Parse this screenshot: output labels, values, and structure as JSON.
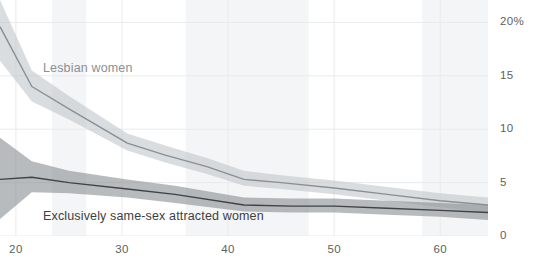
{
  "chart": {
    "background": "#ffffff",
    "plot_width": 488,
    "plot_height": 236,
    "grid": {
      "color": "#e8eaec",
      "band_color": "#f4f5f6",
      "show": true
    },
    "axis": {
      "y_label_color": "#5b5f63",
      "x_label_color": "#5b5f63"
    }
  },
  "labels": {
    "lesbian": "Lesbian women",
    "exclusive": "Exclusively same-sex attracted women"
  },
  "chart_data": {
    "type": "line",
    "title": "",
    "subtitle": "",
    "xlabel": "",
    "ylabel": "",
    "xlim": [
      18.5,
      64.5
    ],
    "ylim": [
      0,
      22.1
    ],
    "grid": true,
    "legend_position": "inline-annotation",
    "yticks": [
      0,
      5,
      10,
      15,
      20
    ],
    "yticklabels": [
      "0",
      "5",
      "10",
      "15",
      "20%"
    ],
    "xticks": [
      20,
      30,
      40,
      50,
      60
    ],
    "xticklabels": [
      "20",
      "30",
      "40",
      "50",
      "60"
    ],
    "shaded_bands": [
      {
        "x0": 23.4,
        "x1": 26.6
      },
      {
        "x0": 36.0,
        "x1": 47.6
      },
      {
        "x0": 58.3,
        "x1": 64.5
      }
    ],
    "series": [
      {
        "name": "Lesbian women",
        "color": "#8a8f93",
        "band_color": "#c4c8cb",
        "x": [
          18.5,
          21.5,
          25.0,
          30.5,
          34.0,
          38.0,
          41.5,
          45.0,
          50.0,
          55.0,
          60.0,
          64.5
        ],
        "values": [
          19.6,
          14.0,
          11.9,
          8.7,
          7.6,
          6.5,
          5.3,
          5.0,
          4.5,
          3.9,
          3.3,
          2.9
        ],
        "lower": [
          16.4,
          12.6,
          10.9,
          8.0,
          6.9,
          5.8,
          4.7,
          4.4,
          3.9,
          3.3,
          2.7,
          2.2
        ],
        "upper": [
          22.1,
          15.5,
          13.1,
          9.6,
          8.5,
          7.3,
          6.1,
          5.7,
          5.2,
          4.6,
          4.0,
          3.6
        ]
      },
      {
        "name": "Exclusively same-sex attracted women",
        "color": "#3f4346",
        "band_color": "#8d9194",
        "x": [
          18.5,
          21.5,
          25.0,
          30.5,
          35.0,
          41.5,
          46.0,
          50.0,
          55.0,
          60.0,
          64.5
        ],
        "values": [
          5.3,
          5.5,
          5.0,
          4.4,
          3.9,
          2.9,
          2.8,
          2.8,
          2.6,
          2.4,
          2.2
        ],
        "lower": [
          1.6,
          4.1,
          4.0,
          3.6,
          3.1,
          2.3,
          2.2,
          2.2,
          2.0,
          1.8,
          1.5
        ],
        "upper": [
          9.2,
          7.0,
          6.1,
          5.3,
          4.7,
          3.6,
          3.5,
          3.5,
          3.3,
          3.1,
          2.9
        ]
      }
    ]
  }
}
